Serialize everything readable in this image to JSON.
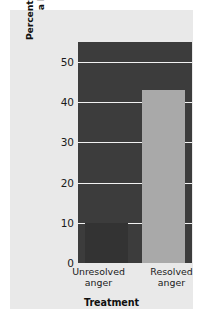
{
  "chart_data": {
    "type": "bar",
    "title": "",
    "categories": [
      "Unresolved anger",
      "Resolved anger"
    ],
    "values": [
      10,
      43
    ],
    "xlabel": "Treatment",
    "ylabel": "Percentage of Children Showing a Decline in Distress",
    "ylim": [
      0,
      55
    ],
    "yticks": [
      0,
      10,
      20,
      30,
      40,
      50
    ],
    "ytick_labels": [
      "0",
      "10",
      "20",
      "30",
      "40",
      "50"
    ],
    "grid": true,
    "legend": null,
    "series": [
      {
        "name": "Percentage of Children Showing a Decline in Distress",
        "values": [
          10,
          43
        ]
      }
    ],
    "bar_colors": [
      "#333333",
      "#a9a9a9"
    ],
    "plot_background": "#3c3c3c",
    "panel_background": "#e9e9e9",
    "gridline_color": "#f2f2f2"
  },
  "axes": {
    "y_title_line1": "Percentage of Children Showing",
    "y_title_line2": "a Decline in Distress",
    "x_title": "Treatment",
    "y_ticks": [
      {
        "label": "50",
        "value": 50
      },
      {
        "label": "40",
        "value": 40
      },
      {
        "label": "30",
        "value": 30
      },
      {
        "label": "20",
        "value": 20
      },
      {
        "label": "10",
        "value": 10
      },
      {
        "label": "0",
        "value": 0
      }
    ],
    "x_ticks": [
      {
        "label": "Unresolved\nanger"
      },
      {
        "label": "Resolved\nanger"
      }
    ]
  },
  "bars": [
    {
      "category": "Unresolved anger",
      "value": 10,
      "color": "#333333"
    },
    {
      "category": "Resolved anger",
      "value": 43,
      "color": "#a9a9a9"
    }
  ]
}
